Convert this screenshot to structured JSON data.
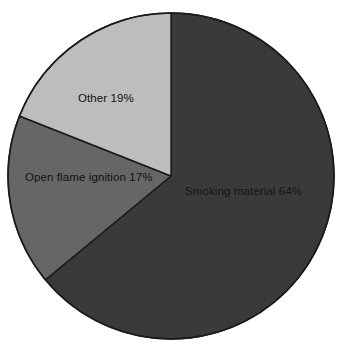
{
  "chart_data": {
    "type": "pie",
    "title": "",
    "subtitle": "",
    "xlabel": "",
    "ylabel": "",
    "grid": false,
    "legend_position": "none",
    "labels_inside_slices": true,
    "start_angle_deg": 0,
    "direction": "clockwise",
    "categories": [
      "Smoking material",
      "Open flame ignition",
      "Other"
    ],
    "values": [
      64,
      17,
      19
    ],
    "units": "percent",
    "slices": [
      {
        "name": "Smoking material",
        "value": 64,
        "label": "Smoking material 64%",
        "color": "#3a3a3a",
        "start_angle_deg": 0,
        "end_angle_deg": 230.4
      },
      {
        "name": "Open flame ignition",
        "value": 17,
        "label": "Open flame ignition 17%",
        "color": "#666666",
        "start_angle_deg": 230.4,
        "end_angle_deg": 291.6
      },
      {
        "name": "Other",
        "value": 19,
        "label": "Other 19%",
        "color": "#bdbdbd",
        "start_angle_deg": 291.6,
        "end_angle_deg": 360
      }
    ]
  },
  "figure": {
    "background_color": "#ffffff",
    "outline_color": "#1a1a1a",
    "center_x": 171,
    "center_y": 176,
    "radius": 163
  }
}
